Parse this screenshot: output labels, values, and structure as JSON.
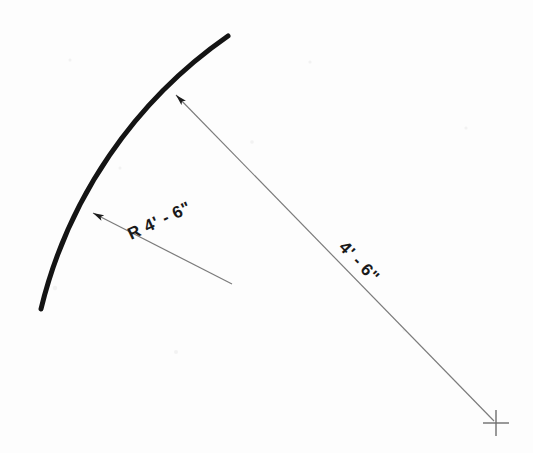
{
  "drawing": {
    "type": "technical-drawing",
    "title": "Arc radius dimensioning detail",
    "background_color": "#fdfdfd",
    "arc": {
      "name": "curved-wall-arc",
      "stroke_color": "#141414",
      "stroke_width": 5,
      "start_point": [
        228,
        36
      ],
      "end_point": [
        41,
        309
      ],
      "radius_px": 466,
      "center_point": [
        496,
        423
      ]
    },
    "center_mark": {
      "name": "radius-center-crossmark",
      "position": [
        496,
        423
      ],
      "size": 26,
      "stroke_color": "#6e6e6e",
      "stroke_width": 1.4
    },
    "radius_dimension_line": {
      "name": "radius-dimension-line",
      "label": "4' - 6\"",
      "from": [
        496,
        422
      ],
      "to": [
        172,
        91
      ],
      "stroke_color": "#7b7b7b",
      "stroke_width": 1.2,
      "arrow_at": "to",
      "label_position": [
        338,
        248
      ],
      "label_rotation_deg": 46
    },
    "radius_leader": {
      "name": "radius-leader-line",
      "label": "R 4' - 6\"",
      "from": [
        232,
        284
      ],
      "to": [
        88,
        210
      ],
      "stroke_color": "#7b7b7b",
      "stroke_width": 1.2,
      "arrow_at": "to",
      "label_position": [
        131,
        240
      ],
      "label_rotation_deg": -25
    },
    "labels": {
      "radius_callout": "R 4' - 6\"",
      "dimension_callout": "4' - 6\""
    }
  }
}
